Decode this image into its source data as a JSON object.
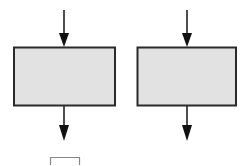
{
  "diagram": {
    "type": "block-flow",
    "colors": {
      "box_fill": "#e2e2e2",
      "stroke": "#222222",
      "background": "#ffffff"
    },
    "blocks": [
      {
        "id": "block-1",
        "x": 13,
        "y": 47,
        "w": 102,
        "h": 59,
        "label": ""
      },
      {
        "id": "block-2",
        "x": 137,
        "y": 47,
        "w": 99,
        "h": 59,
        "label": ""
      }
    ],
    "arrows": [
      {
        "id": "in-1",
        "x": 64,
        "y1": 10,
        "y2": 47
      },
      {
        "id": "out-1",
        "x": 64,
        "y1": 106,
        "y2": 140
      },
      {
        "id": "in-2",
        "x": 187,
        "y1": 10,
        "y2": 47
      },
      {
        "id": "out-2",
        "x": 187,
        "y1": 106,
        "y2": 140
      }
    ],
    "partial_block": {
      "x": 50,
      "y": 157,
      "w": 30
    }
  }
}
